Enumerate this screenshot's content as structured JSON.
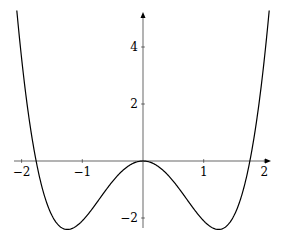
{
  "chart_data": {
    "type": "line",
    "title": "",
    "xlabel": "",
    "ylabel": "",
    "function": "x^4 - 3x^2",
    "xlim": [
      -2.1,
      2.1
    ],
    "ylim": [
      -2.4,
      5.2
    ],
    "x_ticks": [
      -2,
      -1,
      1,
      2
    ],
    "x_tick_labels": [
      "−2",
      "−1",
      "1",
      "2"
    ],
    "y_ticks": [
      -2,
      2,
      4
    ],
    "y_tick_labels": [
      "−2",
      "2",
      "4"
    ],
    "grid": false,
    "legend": null,
    "series": [
      {
        "name": "f(x)",
        "x": [
          -2.09,
          -2.0,
          -1.8,
          -1.6,
          -1.4,
          -1.2247,
          -1.0,
          -0.8,
          -0.6,
          -0.4,
          -0.2,
          0,
          0.2,
          0.4,
          0.6,
          0.8,
          1.0,
          1.2247,
          1.4,
          1.6,
          1.8,
          2.0,
          2.09
        ],
        "values": [
          5.98,
          4.0,
          0.78,
          -1.13,
          -2.04,
          -2.25,
          -2.0,
          -1.51,
          -0.95,
          -0.45,
          -0.12,
          0,
          -0.12,
          -0.45,
          -0.95,
          -1.51,
          -2.0,
          -2.25,
          -2.04,
          -1.13,
          0.78,
          4.0,
          5.98
        ]
      }
    ]
  }
}
